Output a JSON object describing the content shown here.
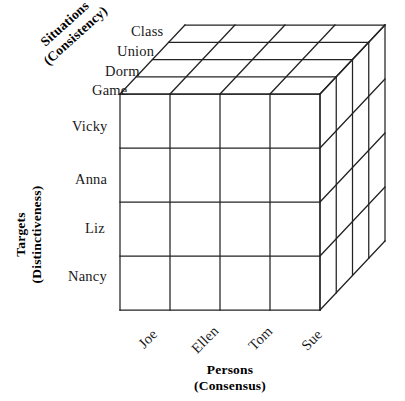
{
  "figure": {
    "type": "kelley-covariation-cube",
    "background_color": "#ffffff",
    "line_color": "#222222"
  },
  "axes": {
    "depth": {
      "title_line1": "Situations",
      "title_line2": "(Consistency)",
      "ticks": [
        "Class",
        "Union",
        "Dorm",
        "Game"
      ]
    },
    "vertical": {
      "title_line1": "Targets",
      "title_line2": "(Distinctiveness)",
      "ticks": [
        "Vicky",
        "Anna",
        "Liz",
        "Nancy"
      ]
    },
    "horizontal": {
      "title_line1": "Persons",
      "title_line2": "(Consensus)",
      "ticks": [
        "Joe",
        "Ellen",
        "Tom",
        "Sue"
      ]
    }
  },
  "geometry": {
    "columns": 4,
    "rows": 4,
    "depth_slices": 4
  }
}
